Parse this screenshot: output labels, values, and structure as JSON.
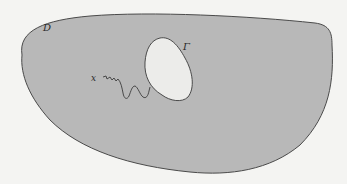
{
  "diagram": {
    "type": "domain-with-hole",
    "labels": {
      "domain": "D",
      "boundary": "Γ",
      "point": "x"
    },
    "colors": {
      "background": "#f4f4f2",
      "domain_fill": "#b8b8b8",
      "hole_fill": "#ececea",
      "stroke": "#4a4a4a"
    }
  }
}
